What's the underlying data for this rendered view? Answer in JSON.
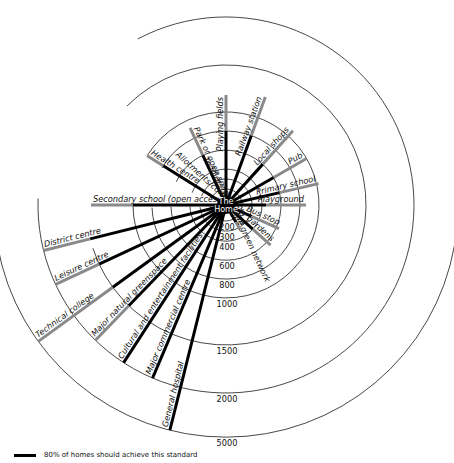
{
  "center": {
    "x": 226,
    "y": 205,
    "label_line1": "The",
    "label_line2": "Home"
  },
  "rings": [
    {
      "label": "200",
      "r": 16
    },
    {
      "label": "300",
      "r": 26
    },
    {
      "label": "400",
      "r": 36
    },
    {
      "label": "600",
      "r": 55
    },
    {
      "label": "800",
      "r": 74
    },
    {
      "label": "1000",
      "r": 93
    },
    {
      "label": "1500",
      "r": 140
    },
    {
      "label": "2000",
      "r": 188
    },
    {
      "label": "5000",
      "r": 232
    }
  ],
  "destinations": [
    {
      "label": "Playground",
      "angle": 0,
      "black_r": 40,
      "end_r": 80
    },
    {
      "label": "Bus stop",
      "angle": 24,
      "black_r": 28,
      "end_r": 58
    },
    {
      "label": "Allotments/community gardens",
      "angle": 42,
      "black_r": 36,
      "end_r": 60
    },
    {
      "label": "Toddlers' play area",
      "angle": 60,
      "black_r": 20,
      "end_r": 28
    },
    {
      "label": "Primary school",
      "angle": -13,
      "black_r": 55,
      "end_r": 95
    },
    {
      "label": "Pub",
      "angle": -30,
      "black_r": 55,
      "end_r": 93
    },
    {
      "label": "Local shops",
      "angle": -48,
      "black_r": 55,
      "end_r": 100
    },
    {
      "label": "Railway station",
      "angle": -70,
      "black_r": 74,
      "end_r": 115
    },
    {
      "label": "Playing fields",
      "angle": -90,
      "black_r": 74,
      "end_r": 110
    },
    {
      "label": "Park or open space on the green network",
      "angle": -115,
      "black_r": 55,
      "end_r": 85
    },
    {
      "label": "Health centre",
      "angle": -148,
      "black_r": 74,
      "end_r": 93
    },
    {
      "label": "Secondary school (open access)",
      "angle": 180,
      "black_r": 93,
      "end_r": 135
    },
    {
      "label": "District centre",
      "angle": 166,
      "black_r": 140,
      "end_r": 188
    },
    {
      "label": "Leisure centre",
      "angle": 155,
      "black_r": 140,
      "end_r": 188
    },
    {
      "label": "Technical college",
      "angle": 144,
      "black_r": 140,
      "end_r": 232
    },
    {
      "label": "Major natural greenspace",
      "angle": 134,
      "black_r": 140,
      "end_r": 188
    },
    {
      "label": "Cultural and entertainment facilities",
      "angle": 123,
      "black_r": 188,
      "end_r": 188
    },
    {
      "label": "Major commercial centre",
      "angle": 113,
      "black_r": 188,
      "end_r": 188
    },
    {
      "label": "General hospital",
      "angle": 104,
      "black_r": 232,
      "end_r": 232
    }
  ],
  "legend": {
    "text": "80% of homes should achieve this standard",
    "color": "#000000"
  },
  "colors": {
    "standard_80pct": "#000000",
    "extended": "#8a8a8a",
    "ring": "#333333"
  }
}
